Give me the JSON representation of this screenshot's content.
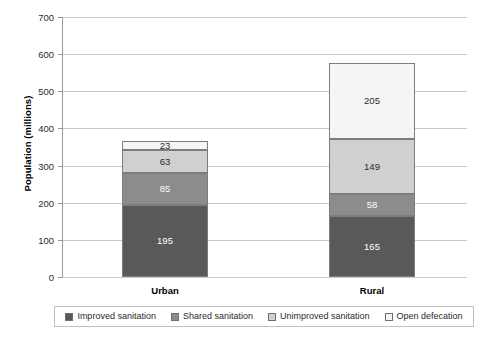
{
  "chart_data": {
    "type": "bar",
    "stacked": true,
    "title": "",
    "xlabel": "",
    "ylabel": "Population (millions)",
    "ylim": [
      0,
      700
    ],
    "ytick_step": 100,
    "yticks": [
      0,
      100,
      200,
      300,
      400,
      500,
      600,
      700
    ],
    "ytick_labels": [
      "0",
      "100",
      "200",
      "300",
      "400",
      "500",
      "600",
      "700"
    ],
    "grid": "horizontal",
    "legend_position": "bottom",
    "categories": [
      "Urban",
      "Rural"
    ],
    "series": [
      {
        "name": "Improved sanitation",
        "color": "#595959",
        "label_color": "light",
        "values": [
          195,
          165
        ]
      },
      {
        "name": "Shared sanitation",
        "color": "#8c8c8c",
        "label_color": "light",
        "values": [
          85,
          58
        ]
      },
      {
        "name": "Unimproved sanitation",
        "color": "#d0d0d0",
        "label_color": "dark",
        "values": [
          63,
          149
        ]
      },
      {
        "name": "Open defecation",
        "color": "#f5f5f5",
        "label_color": "dark",
        "values": [
          23,
          205
        ]
      }
    ],
    "totals": [
      366,
      577
    ]
  },
  "legend": {
    "items": [
      {
        "label": "Improved sanitation",
        "color": "#595959"
      },
      {
        "label": "Shared sanitation",
        "color": "#8c8c8c"
      },
      {
        "label": "Unimproved sanitation",
        "color": "#d0d0d0"
      },
      {
        "label": "Open defecation",
        "color": "#f5f5f5"
      }
    ]
  }
}
